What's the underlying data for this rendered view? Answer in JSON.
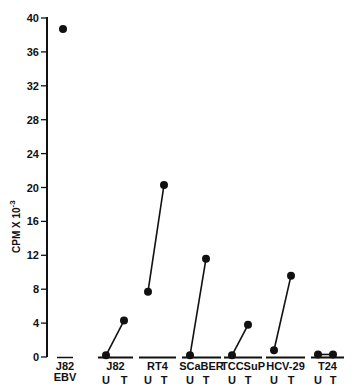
{
  "chart_data": {
    "type": "scatter",
    "title": "",
    "xlabel": "",
    "ylabel": "CPM X 10^-3",
    "ylabel_main": "CPM X 10",
    "ylabel_sup": "-3",
    "ylim": [
      0,
      40
    ],
    "yticks": [
      0,
      4,
      8,
      12,
      16,
      20,
      24,
      28,
      32,
      36,
      40
    ],
    "grid": false,
    "legend": null,
    "categories": [
      "J82 EBV",
      "J82",
      "RT4",
      "SCaBER",
      "TCCSuP",
      "HCV-29",
      "T24"
    ],
    "groups": [
      {
        "name": "J82",
        "sublabel": "EBV",
        "points": [
          {
            "condition": "",
            "value": 38.7
          }
        ],
        "connected": false,
        "overline": true
      },
      {
        "name": "J82",
        "sublabel": "",
        "points": [
          {
            "condition": "U",
            "value": 0.2
          },
          {
            "condition": "T",
            "value": 4.3
          }
        ],
        "connected": true
      },
      {
        "name": "RT4",
        "sublabel": "",
        "points": [
          {
            "condition": "U",
            "value": 7.7
          },
          {
            "condition": "T",
            "value": 20.3
          }
        ],
        "connected": true
      },
      {
        "name": "SCaBER",
        "sublabel": "",
        "points": [
          {
            "condition": "U",
            "value": 0.2
          },
          {
            "condition": "T",
            "value": 11.6
          }
        ],
        "connected": true
      },
      {
        "name": "TCCSuP",
        "sublabel": "",
        "points": [
          {
            "condition": "U",
            "value": 0.2
          },
          {
            "condition": "T",
            "value": 3.8
          }
        ],
        "connected": true
      },
      {
        "name": "HCV-29",
        "sublabel": "",
        "points": [
          {
            "condition": "U",
            "value": 0.8
          },
          {
            "condition": "T",
            "value": 9.6
          }
        ],
        "connected": true
      },
      {
        "name": "T24",
        "sublabel": "",
        "points": [
          {
            "condition": "U",
            "value": 0.3
          },
          {
            "condition": "T",
            "value": 0.3
          }
        ],
        "connected": true
      }
    ],
    "series": [
      {
        "name": "U",
        "values": [
          null,
          0.2,
          7.7,
          0.2,
          0.2,
          0.8,
          0.3
        ]
      },
      {
        "name": "T",
        "values": [
          null,
          4.3,
          20.3,
          11.6,
          3.8,
          9.6,
          0.3
        ]
      },
      {
        "name": "EBV",
        "values": [
          38.7,
          null,
          null,
          null,
          null,
          null,
          null
        ]
      }
    ]
  },
  "layout": {
    "y_axis_x": 47,
    "y_top_px": 18,
    "y_zero_px": 357,
    "groups_px": [
      {
        "x0": 57,
        "x1": 73,
        "xu": 63,
        "xt": 63
      },
      {
        "x0": 98,
        "x1": 133,
        "xu": 106,
        "xt": 124
      },
      {
        "x0": 139,
        "x1": 176,
        "xu": 148,
        "xt": 164
      },
      {
        "x0": 182,
        "x1": 221,
        "xu": 190,
        "xt": 206
      },
      {
        "x0": 224,
        "x1": 262,
        "xu": 232,
        "xt": 248
      },
      {
        "x0": 266,
        "x1": 305,
        "xu": 274,
        "xt": 291
      },
      {
        "x0": 311,
        "x1": 344,
        "xu": 318,
        "xt": 333
      }
    ]
  }
}
